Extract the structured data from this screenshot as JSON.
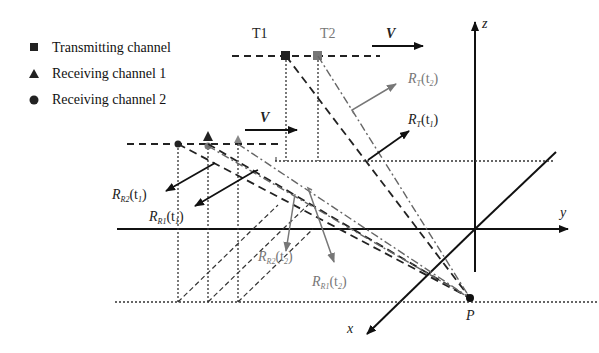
{
  "legend": {
    "items": [
      {
        "symbol": "square",
        "label": "Transmitting channel"
      },
      {
        "symbol": "triangle",
        "label": "Receiving channel 1"
      },
      {
        "symbol": "circle",
        "label": "Receiving channel 2"
      }
    ]
  },
  "labels": {
    "t1": "T1",
    "t2": "T2",
    "velocity_top": "V",
    "velocity_mid": "V",
    "axis_x": "x",
    "axis_y": "y",
    "axis_z": "z",
    "point_p": "P",
    "rt_t2": {
      "main": "R",
      "sub": "T",
      "arg": "(t",
      "argsub": "2",
      "close": ")"
    },
    "rt_t1": {
      "main": "R",
      "sub": "T",
      "arg": "(t",
      "argsub": "1",
      "close": ")"
    },
    "rr2_t1": {
      "main": "R",
      "sub": "R2",
      "arg": "(t",
      "argsub": "1",
      "close": ")"
    },
    "rr1_t1": {
      "main": "R",
      "sub": "R1",
      "arg": "(t",
      "argsub": "1",
      "close": ")"
    },
    "rr2_t2": {
      "main": "R",
      "sub": "R2",
      "arg": "(t",
      "argsub": "2",
      "close": ")"
    },
    "rr1_t2": {
      "main": "R",
      "sub": "R1",
      "arg": "(t",
      "argsub": "2",
      "close": ")"
    }
  },
  "colors": {
    "black": "#111111",
    "gray": "#777777",
    "dark_gray": "#555555"
  }
}
